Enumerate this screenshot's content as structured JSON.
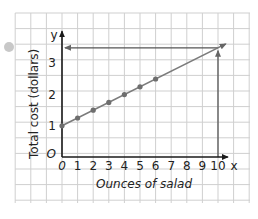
{
  "chart_data": {
    "type": "line",
    "title": "",
    "xlabel": "Ounces of salad",
    "ylabel": "Total cost (dollars)",
    "x_axis_letter": "x",
    "y_axis_letter": "y",
    "origin_label": "O",
    "xticks": [
      0,
      1,
      2,
      3,
      4,
      5,
      6,
      7,
      8,
      9,
      10
    ],
    "yticks": [
      1,
      2,
      3
    ],
    "xlim": [
      0,
      10.5
    ],
    "ylim": [
      0,
      3.9
    ],
    "grid": true,
    "series": [
      {
        "name": "Total cost",
        "x": [
          0,
          1,
          2,
          3,
          4,
          5,
          6
        ],
        "y": [
          1.0,
          1.25,
          1.5,
          1.75,
          2.0,
          2.25,
          2.5
        ],
        "line": {
          "from": [
            0,
            1.0
          ],
          "to": [
            10.5,
            3.625
          ],
          "slope": 0.25,
          "intercept": 1.0
        }
      }
    ],
    "annotations": [
      {
        "type": "arrow-vertical",
        "x": 10,
        "from_y": 0,
        "to_y": 3.5
      },
      {
        "type": "arrow-horizontal",
        "y": 3.5,
        "from_x": 10,
        "to_x": 0
      }
    ]
  },
  "colors": {
    "grid": "#cfcfcf",
    "axis": "#1a1a1a",
    "line": "#7a7a7a",
    "points": "#6e6e6e",
    "guide": "#555555",
    "bullet": "#c8c8c8"
  }
}
